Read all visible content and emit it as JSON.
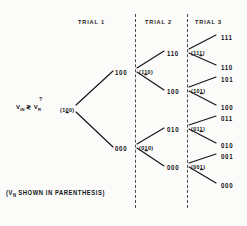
{
  "figure": {
    "caption_prefix": "(V",
    "caption_sub": "N",
    "caption_suffix": " SHOWN IN PARENTHESIS)",
    "root_expr_prefix": "V",
    "root_expr_sub1": "IN",
    "root_expr_mid": " ≷ V",
    "root_expr_sub2": "R",
    "root_question_mark": "?",
    "ink_color": "#14141a",
    "background_color": "#fbfbf9",
    "divider_color": "#4a4a50"
  },
  "headers": [
    {
      "label": "TRIAL 1",
      "x": 78,
      "y": 19
    },
    {
      "label": "TRIAL 2",
      "x": 145,
      "y": 19
    },
    {
      "label": "TRIAL 3",
      "x": 195,
      "y": 19
    }
  ],
  "dividers": [
    {
      "name": "divider-trial1-trial2",
      "x": 135,
      "y": 14,
      "height": 194
    },
    {
      "name": "divider-trial2-trial3",
      "x": 187,
      "y": 14,
      "height": 194
    }
  ],
  "nodes": [
    {
      "name": "root-node",
      "paren": "(100)",
      "underline_index": 1,
      "x": 60,
      "y": 107
    },
    {
      "name": "trial2-upper-node",
      "paren": "(110)",
      "underline_index": 1,
      "x": 139,
      "y": 69
    },
    {
      "name": "trial2-lower-node",
      "paren": "(010)",
      "underline_index": 1,
      "x": 139,
      "y": 145
    },
    {
      "name": "trial3-node-1",
      "paren": "(111)",
      "underline_index": 2,
      "x": 191,
      "y": 50
    },
    {
      "name": "trial3-node-2",
      "paren": "(101)",
      "underline_index": 2,
      "x": 191,
      "y": 88
    },
    {
      "name": "trial3-node-3",
      "paren": "(011)",
      "underline_index": 2,
      "x": 191,
      "y": 126
    },
    {
      "name": "trial3-node-4",
      "paren": "(001)",
      "underline_index": 2,
      "x": 191,
      "y": 164
    }
  ],
  "branch_labels": [
    {
      "name": "trial1-output-upper",
      "label": "100",
      "x": 115,
      "y": 69
    },
    {
      "name": "trial1-output-lower",
      "label": "000",
      "x": 115,
      "y": 145
    },
    {
      "name": "trial2-output-1",
      "label": "110",
      "x": 167,
      "y": 50
    },
    {
      "name": "trial2-output-2",
      "label": "100",
      "x": 167,
      "y": 88
    },
    {
      "name": "trial2-output-3",
      "label": "010",
      "x": 167,
      "y": 126
    },
    {
      "name": "trial2-output-4",
      "label": "000",
      "x": 167,
      "y": 164
    }
  ],
  "terminals": [
    {
      "name": "terminal-111",
      "label": "111",
      "x": 221,
      "y": 34
    },
    {
      "name": "terminal-110",
      "label": "110",
      "x": 221,
      "y": 64
    },
    {
      "name": "terminal-101",
      "label": "101",
      "x": 221,
      "y": 76
    },
    {
      "name": "terminal-100",
      "label": "100",
      "x": 221,
      "y": 104
    },
    {
      "name": "terminal-011",
      "label": "011",
      "x": 221,
      "y": 115
    },
    {
      "name": "terminal-010",
      "label": "010",
      "x": 221,
      "y": 142
    },
    {
      "name": "terminal-001",
      "label": "001",
      "x": 221,
      "y": 153
    },
    {
      "name": "terminal-000",
      "label": "000",
      "x": 221,
      "y": 182
    }
  ],
  "edges": [
    {
      "name": "edge-root-up",
      "x1": 76,
      "y1": 105,
      "x2": 113,
      "y2": 71
    },
    {
      "name": "edge-root-down",
      "x1": 76,
      "y1": 112,
      "x2": 113,
      "y2": 147
    },
    {
      "name": "edge-t2u-up",
      "x1": 137,
      "y1": 68,
      "x2": 164,
      "y2": 51
    },
    {
      "name": "edge-t2u-down",
      "x1": 137,
      "y1": 72,
      "x2": 164,
      "y2": 90
    },
    {
      "name": "edge-t2l-up",
      "x1": 137,
      "y1": 144,
      "x2": 164,
      "y2": 128
    },
    {
      "name": "edge-t2l-down",
      "x1": 137,
      "y1": 148,
      "x2": 164,
      "y2": 166
    },
    {
      "name": "edge-t3a-up",
      "x1": 189,
      "y1": 49,
      "x2": 216,
      "y2": 35
    },
    {
      "name": "edge-t3a-down",
      "x1": 189,
      "y1": 53,
      "x2": 216,
      "y2": 65
    },
    {
      "name": "edge-t3b-up",
      "x1": 189,
      "y1": 87,
      "x2": 216,
      "y2": 77
    },
    {
      "name": "edge-t3b-down",
      "x1": 189,
      "y1": 91,
      "x2": 216,
      "y2": 105
    },
    {
      "name": "edge-t3c-up",
      "x1": 189,
      "y1": 125,
      "x2": 216,
      "y2": 116
    },
    {
      "name": "edge-t3c-down",
      "x1": 189,
      "y1": 129,
      "x2": 216,
      "y2": 143
    },
    {
      "name": "edge-t3d-up",
      "x1": 189,
      "y1": 163,
      "x2": 216,
      "y2": 154
    },
    {
      "name": "edge-t3d-down",
      "x1": 189,
      "y1": 167,
      "x2": 216,
      "y2": 183
    }
  ]
}
